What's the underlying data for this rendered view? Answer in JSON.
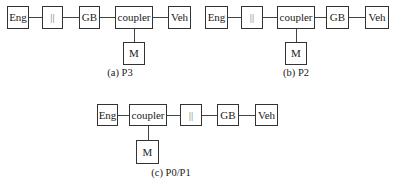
{
  "diagrams": {
    "a": {
      "caption": "(a) P3",
      "chain": [
        "Eng",
        "||",
        "GB",
        "coupler",
        "Veh"
      ],
      "motor": "M",
      "motor_attached_to": "coupler"
    },
    "b": {
      "caption": "(b) P2",
      "chain": [
        "Eng",
        "||",
        "coupler",
        "GB",
        "Veh"
      ],
      "motor": "M",
      "motor_attached_to": "coupler"
    },
    "c": {
      "caption": "(c) P0/P1",
      "chain": [
        "Eng",
        "coupler",
        "||",
        "GB",
        "Veh"
      ],
      "motor": "M",
      "motor_attached_to": "coupler"
    }
  }
}
